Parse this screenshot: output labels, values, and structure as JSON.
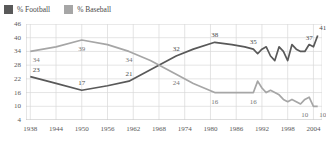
{
  "legend": {
    "position": "top-left",
    "items": [
      {
        "label": "% Football",
        "color": "#595959",
        "icon": "square-swatch-icon"
      },
      {
        "label": "% Baseball",
        "color": "#a6a6a6",
        "icon": "square-swatch-icon"
      }
    ]
  },
  "colors": {
    "football": "#595959",
    "baseball": "#a6a6a6",
    "grid": "#d9d9d9",
    "axis": "#bfbfbf",
    "text": "#4a4a4a"
  },
  "chart_data": {
    "type": "line",
    "title": "",
    "subtitle": "",
    "xlabel": "",
    "ylabel": "",
    "xlim": [
      1937,
      2006
    ],
    "ylim": [
      4,
      46
    ],
    "yticks": [
      4,
      10,
      16,
      22,
      28,
      34,
      40,
      46
    ],
    "xticks": [
      1938,
      1944,
      1950,
      1956,
      1962,
      1968,
      1974,
      1980,
      1986,
      1992,
      1998,
      2004
    ],
    "grid": true,
    "legend_position": "top-left",
    "series": [
      {
        "name": "% Football",
        "color": "#595959",
        "x": [
          1938,
          1944,
          1950,
          1956,
          1961,
          1966,
          1972,
          1976,
          1981,
          1985,
          1988,
          1990,
          1991,
          1992,
          1993,
          1994,
          1995,
          1996,
          1997,
          1998,
          1999,
          2000,
          2001,
          2002,
          2003,
          2004,
          2005
        ],
        "values": [
          23,
          20,
          17,
          19,
          21,
          26,
          32,
          35,
          38,
          37,
          36,
          35,
          33,
          35,
          36,
          32,
          30,
          36,
          34,
          30,
          37,
          35,
          34,
          34,
          37,
          36,
          41
        ],
        "labels": [
          {
            "x": 1938,
            "value": 23
          },
          {
            "x": 1950,
            "value": 17
          },
          {
            "x": 1961,
            "value": 21
          },
          {
            "x": 1972,
            "value": 32
          },
          {
            "x": 1981,
            "value": 38
          },
          {
            "x": 1990,
            "value": 35
          },
          {
            "x": 2003,
            "value": 37
          },
          {
            "x": 2005,
            "value": 41
          }
        ]
      },
      {
        "name": "% Baseball",
        "color": "#a6a6a6",
        "x": [
          1938,
          1944,
          1950,
          1956,
          1961,
          1966,
          1972,
          1976,
          1981,
          1985,
          1988,
          1990,
          1991,
          1992,
          1993,
          1994,
          1995,
          1996,
          1997,
          1998,
          1999,
          2000,
          2001,
          2002,
          2003,
          2004,
          2005
        ],
        "values": [
          34,
          36,
          39,
          37,
          34,
          30,
          24,
          20,
          16,
          16,
          16,
          16,
          21,
          18,
          16,
          17,
          16,
          15,
          13,
          12,
          13,
          12,
          11,
          13,
          14,
          10,
          10
        ],
        "labels": [
          {
            "x": 1938,
            "value": 34
          },
          {
            "x": 1950,
            "value": 39
          },
          {
            "x": 1961,
            "value": 34
          },
          {
            "x": 1972,
            "value": 24
          },
          {
            "x": 1981,
            "value": 16
          },
          {
            "x": 1990,
            "value": 16
          },
          {
            "x": 2002,
            "value": 10
          },
          {
            "x": 2005,
            "value": 10
          }
        ]
      }
    ]
  }
}
